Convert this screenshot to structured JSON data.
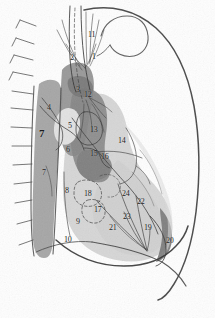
{
  "figure": {
    "type": "anatomical-line-diagram",
    "background_color": "#fefefe",
    "palette": {
      "ink": "#2a2a2a",
      "light_tissue": "#d2d2d2",
      "mid_tissue": "#a9a9a9",
      "dark_tissue": "#8d8d8d",
      "darkest_tissue": "#787878",
      "pale_tissue": "#e4e4e4",
      "label_ink": "#1d1d1d"
    }
  },
  "labels": [
    {
      "id": "1",
      "text": "1",
      "x": 92,
      "y": 53,
      "size": "small"
    },
    {
      "id": "2",
      "text": "2",
      "x": 70,
      "y": 54,
      "size": "small"
    },
    {
      "id": "3",
      "text": "3",
      "x": 76,
      "y": 86,
      "size": "small"
    },
    {
      "id": "4",
      "text": "4",
      "x": 47,
      "y": 104,
      "size": "small"
    },
    {
      "id": "5",
      "text": "5",
      "x": 68,
      "y": 122,
      "size": "small"
    },
    {
      "id": "6",
      "text": "6",
      "x": 66,
      "y": 146,
      "size": "small"
    },
    {
      "id": "7a",
      "text": "7",
      "x": 39,
      "y": 128,
      "size": "big"
    },
    {
      "id": "7b",
      "text": "7",
      "x": 42,
      "y": 169,
      "size": "small"
    },
    {
      "id": "8",
      "text": "8",
      "x": 65,
      "y": 187,
      "size": "small"
    },
    {
      "id": "9",
      "text": "9",
      "x": 76,
      "y": 218,
      "size": "small"
    },
    {
      "id": "10",
      "text": "10",
      "x": 64,
      "y": 236,
      "size": "small"
    },
    {
      "id": "11",
      "text": "11",
      "x": 88,
      "y": 31,
      "size": "small"
    },
    {
      "id": "12",
      "text": "12",
      "x": 84,
      "y": 91,
      "size": "small"
    },
    {
      "id": "13",
      "text": "13",
      "x": 90,
      "y": 126,
      "size": "small"
    },
    {
      "id": "14",
      "text": "14",
      "x": 118,
      "y": 137,
      "size": "small"
    },
    {
      "id": "15",
      "text": "15",
      "x": 90,
      "y": 150,
      "size": "small"
    },
    {
      "id": "16",
      "text": "16",
      "x": 101,
      "y": 153,
      "size": "small"
    },
    {
      "id": "17",
      "text": "17",
      "x": 94,
      "y": 206,
      "size": "small"
    },
    {
      "id": "18",
      "text": "18",
      "x": 84,
      "y": 190,
      "size": "small"
    },
    {
      "id": "19",
      "text": "19",
      "x": 144,
      "y": 224,
      "size": "small"
    },
    {
      "id": "20",
      "text": "20",
      "x": 166,
      "y": 237,
      "size": "small"
    },
    {
      "id": "21",
      "text": "21",
      "x": 109,
      "y": 224,
      "size": "small"
    },
    {
      "id": "22",
      "text": "22",
      "x": 137,
      "y": 198,
      "size": "small"
    },
    {
      "id": "23",
      "text": "23",
      "x": 123,
      "y": 213,
      "size": "small"
    },
    {
      "id": "24",
      "text": "24",
      "x": 122,
      "y": 190,
      "size": "small"
    }
  ],
  "regions": [
    {
      "name": "posterior-chest-wall-band",
      "tone": "mid_tissue"
    },
    {
      "name": "lung-field",
      "tone": "light_tissue"
    },
    {
      "name": "heart-mediastinum-shadow",
      "tone": "dark_tissue"
    },
    {
      "name": "aortic-knob-pale",
      "tone": "pale_tissue"
    },
    {
      "name": "posterior-costophrenic-crescent",
      "tone": "darkest_tissue"
    },
    {
      "name": "upper-mediastinal-stripe",
      "tone": "dark_tissue"
    }
  ],
  "structures": [
    {
      "name": "anterior-chest-wall-outline"
    },
    {
      "name": "aortic-arch-loop"
    },
    {
      "name": "diaphragm-dome-line"
    },
    {
      "name": "vertebral-spinous-process-spurs",
      "count": 12
    },
    {
      "name": "bronchovascular-markings"
    },
    {
      "name": "fissure-lines"
    },
    {
      "name": "leader-lines"
    }
  ]
}
